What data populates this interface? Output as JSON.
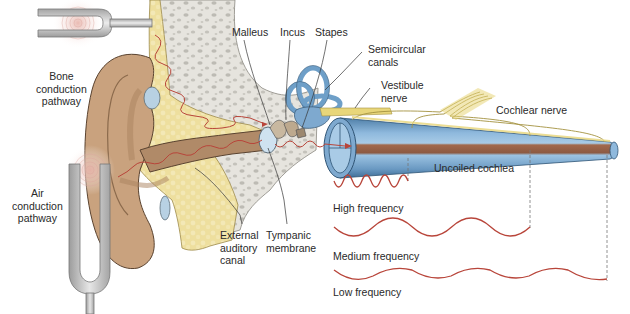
{
  "figure": {
    "colors": {
      "skin": "#c9a27e",
      "skin_dark": "#a9825e",
      "bone": "#e4e2dc",
      "bone_spots": "#b9b7b0",
      "tissue_yellow": "#ecdc9a",
      "cochlea_blue": "#6e9fc8",
      "cochlea_light": "#a9cbe6",
      "basilar_brown": "#a0664a",
      "wave_red": "#b8453a",
      "nerve_yellow": "#e8d67a",
      "fork_gray": "#c8c8c8",
      "leader_line": "#333333"
    }
  },
  "labels": {
    "bone_conduction": "Bone\nconduction\npathway",
    "air_conduction": "Air\nconduction\npathway",
    "malleus": "Malleus",
    "incus": "Incus",
    "stapes": "Stapes",
    "semicircular_canals": "Semicircular\ncanals",
    "vestibule_nerve": "Vestibule\nnerve",
    "cochlear_nerve": "Cochlear nerve",
    "uncoiled_cochlea": "Uncoiled cochlea",
    "external_auditory_canal": "External\nauditory\ncanal",
    "tympanic_membrane": "Tympanic\nmembrane",
    "high_frequency": "High frequency",
    "medium_frequency": "Medium frequency",
    "low_frequency": "Low frequency"
  },
  "frequency_waves": [
    {
      "name": "High frequency",
      "x_start": 334,
      "x_end": 408,
      "y": 187,
      "cycles": 4,
      "amplitude": 6
    },
    {
      "name": "Medium frequency",
      "x_start": 334,
      "x_end": 530,
      "y": 232,
      "cycles": 5,
      "amplitude": 9
    },
    {
      "name": "Low frequency",
      "x_start": 334,
      "x_end": 607,
      "y": 276,
      "cycles": 3.5,
      "amplitude": 6
    }
  ]
}
